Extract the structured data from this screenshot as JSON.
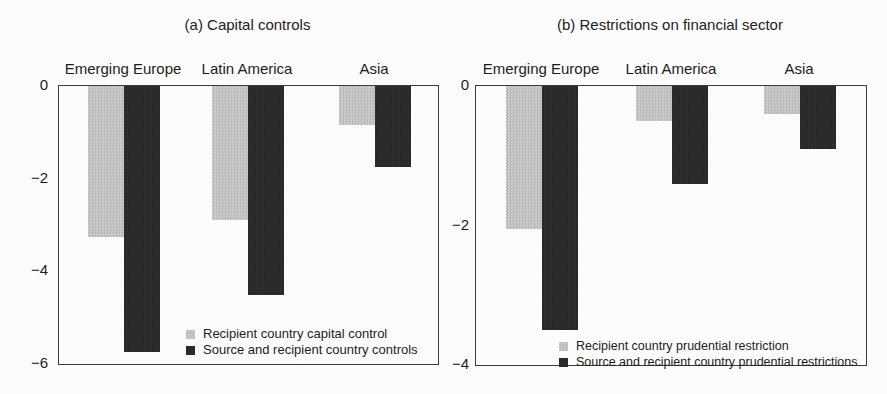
{
  "figure": {
    "background": "#fcfcfc",
    "text_color": "#1c1c1c",
    "frame_color": "#3d3d3d"
  },
  "chart_data": [
    {
      "type": "bar",
      "title": "(a) Capital controls",
      "categories": [
        "Emerging Europe",
        "Latin America",
        "Asia"
      ],
      "series": [
        {
          "name": "Recipient country capital control",
          "color": "#c3c3c3",
          "values": [
            -3.25,
            -2.9,
            -0.85
          ]
        },
        {
          "name": "Source and recipient country controls",
          "color": "#2b2b2b",
          "values": [
            -5.75,
            -4.5,
            -1.75
          ]
        }
      ],
      "xlabel": "",
      "ylabel": "",
      "ylim": [
        -6,
        0
      ],
      "yticks": [
        0,
        -2,
        -4,
        -6
      ],
      "ytick_labels": [
        "0",
        "−2",
        "−4",
        "−6"
      ],
      "grid": false,
      "legend_position": "inside-bottom-center"
    },
    {
      "type": "bar",
      "title": "(b) Restrictions on financial sector",
      "categories": [
        "Emerging Europe",
        "Latin America",
        "Asia"
      ],
      "series": [
        {
          "name": "Recipient country prudential restriction",
          "color": "#c3c3c3",
          "values": [
            -2.05,
            -0.5,
            -0.4
          ]
        },
        {
          "name": "Source and recipient country prudential restrictions",
          "color": "#2b2b2b",
          "values": [
            -3.5,
            -1.4,
            -0.9
          ]
        }
      ],
      "xlabel": "",
      "ylabel": "",
      "ylim": [
        -4,
        0
      ],
      "yticks": [
        0,
        -2,
        -4
      ],
      "ytick_labels": [
        "0",
        "−2",
        "−4"
      ],
      "grid": false,
      "legend_position": "inside-bottom-center"
    }
  ]
}
